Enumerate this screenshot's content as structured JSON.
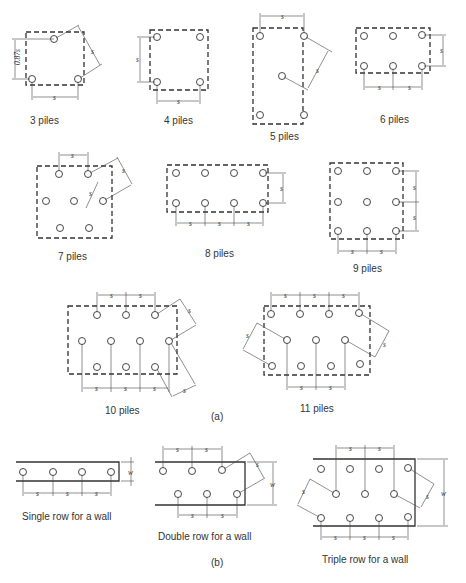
{
  "figure": {
    "part_a_label": "(a)",
    "part_b_label": "(b)",
    "dimension_symbols": {
      "spacing": "s",
      "width": "w",
      "triangle_height": "0.87s"
    },
    "pile_groups": [
      {
        "id": "3",
        "caption": "3 piles",
        "piles": 3
      },
      {
        "id": "4",
        "caption": "4 piles",
        "piles": 4
      },
      {
        "id": "5",
        "caption": "5 piles",
        "piles": 5
      },
      {
        "id": "6",
        "caption": "6 piles",
        "piles": 6
      },
      {
        "id": "7",
        "caption": "7 piles",
        "piles": 7
      },
      {
        "id": "8",
        "caption": "8 piles",
        "piles": 8
      },
      {
        "id": "9",
        "caption": "9 piles",
        "piles": 9
      },
      {
        "id": "10",
        "caption": "10 piles",
        "piles": 10
      },
      {
        "id": "11",
        "caption": "11 piles",
        "piles": 11
      }
    ],
    "wall_groups": [
      {
        "id": "single",
        "caption": "Single row for a wall"
      },
      {
        "id": "double",
        "caption": "Double row for a wall"
      },
      {
        "id": "triple",
        "caption": "Triple row for a wall"
      }
    ]
  }
}
